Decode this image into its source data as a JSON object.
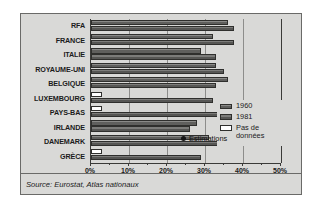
{
  "chart_data": {
    "type": "bar",
    "orientation": "horizontal",
    "title": "",
    "xlabel": "",
    "ylabel": "",
    "xlim": [
      0,
      50
    ],
    "x_unit": "%",
    "grid": true,
    "legend_position": "inside-right",
    "categories": [
      "RFA",
      "FRANCE",
      "ITALIE",
      "ROYAUME-UNI",
      "BELGIQUE",
      "LUXEMBOURG",
      "PAYS-BAS",
      "IRLANDE",
      "DANEMARK",
      "GRÈCE"
    ],
    "tick_labels": [
      "0%",
      "10%",
      "20%",
      "30%",
      "40%",
      "50%"
    ],
    "tick_values": [
      0,
      10,
      20,
      30,
      40,
      50
    ],
    "series": [
      {
        "name": "1960",
        "values": [
          36.0,
          32.0,
          29.0,
          33.0,
          36.0,
          null,
          null,
          28.0,
          31.0,
          null
        ],
        "missing": [
          false,
          false,
          false,
          false,
          false,
          true,
          true,
          false,
          false,
          true
        ],
        "missing_stub": 3.0
      },
      {
        "name": "1981",
        "values": [
          37.5,
          37.5,
          33.0,
          35.0,
          33.0,
          32.0,
          34.0,
          26.0,
          45.0,
          29.0
        ],
        "missing": [
          false,
          false,
          false,
          false,
          false,
          false,
          false,
          false,
          false,
          false
        ]
      }
    ],
    "legend": [
      {
        "label": "1960",
        "swatch": "series-1960"
      },
      {
        "label": "1981",
        "swatch": "series-1981"
      },
      {
        "label": "Pas de\ndonnées",
        "swatch": "no-data"
      }
    ],
    "annotations": [
      {
        "text": "Estimations",
        "target_categories": [
          "IRLANDE"
        ]
      }
    ],
    "source": "Source: Eurostat, Atlas nationaux"
  }
}
